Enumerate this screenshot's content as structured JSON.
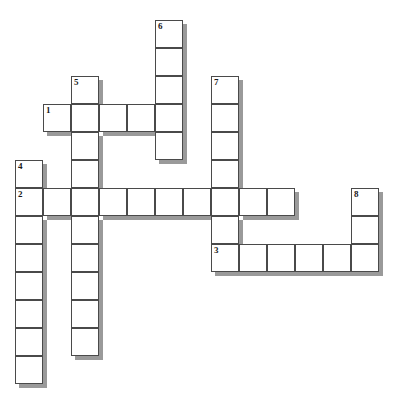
{
  "puzzle": {
    "type": "crossword-grid",
    "title": "Crossword Puzzle Grid",
    "grid": {
      "cell_size_px": 28,
      "origin_x_px": 15,
      "origin_y_px": 20,
      "columns": 14,
      "rows": 14
    },
    "colors": {
      "cell_fill": "#ffffff",
      "cell_border": "#4a4a4a",
      "cell_shadow": "#9a9a9a",
      "number_text": "#1a1a1a",
      "background": "#ffffff"
    },
    "entries": [
      {
        "number": "1",
        "direction": "across",
        "start_col": 1,
        "start_row": 3,
        "length": 5
      },
      {
        "number": "2",
        "direction": "across",
        "start_col": 0,
        "start_row": 6,
        "length": 10
      },
      {
        "number": "3",
        "direction": "across",
        "start_col": 7,
        "start_row": 8,
        "length": 6
      },
      {
        "number": "4",
        "direction": "down",
        "start_col": 0,
        "start_row": 5,
        "length": 8
      },
      {
        "number": "5",
        "direction": "down",
        "start_col": 2,
        "start_row": 2,
        "length": 10
      },
      {
        "number": "6",
        "direction": "down",
        "start_col": 5,
        "start_row": 0,
        "length": 5
      },
      {
        "number": "7",
        "direction": "down",
        "start_col": 7,
        "start_row": 2,
        "length": 6
      },
      {
        "number": "8",
        "direction": "down",
        "start_col": 12,
        "start_row": 6,
        "length": 3
      }
    ],
    "numbered_cells": [
      {
        "label": "1",
        "col": 1,
        "row": 3
      },
      {
        "label": "2",
        "col": 0,
        "row": 6
      },
      {
        "label": "3",
        "col": 7,
        "row": 8
      },
      {
        "label": "4",
        "col": 0,
        "row": 5
      },
      {
        "label": "5",
        "col": 2,
        "row": 2
      },
      {
        "label": "6",
        "col": 5,
        "row": 0
      },
      {
        "label": "7",
        "col": 7,
        "row": 2
      },
      {
        "label": "8",
        "col": 12,
        "row": 6
      }
    ]
  }
}
